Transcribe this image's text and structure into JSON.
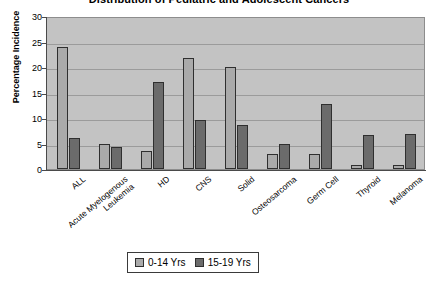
{
  "chart_data": {
    "type": "bar",
    "title": "Distribution of Pediatric and Adolescent Cancers",
    "xlabel": "",
    "ylabel": "Percentage Incidence",
    "ylim": [
      0,
      30
    ],
    "ytick_step": 5,
    "yticks": [
      0,
      5,
      10,
      15,
      20,
      25,
      30
    ],
    "grid": true,
    "legend_position": "bottom",
    "categories": [
      "ALL",
      "Acute Myelogenous Leukemia",
      "HD",
      "CNS",
      "Solid",
      "Osteosarcoma",
      "Germ Cell",
      "Thyroid",
      "Melanoma"
    ],
    "category_lines": [
      [
        "ALL",
        ""
      ],
      [
        "Acute Myelogenous",
        "Leukemia"
      ],
      [
        "HD",
        ""
      ],
      [
        "CNS",
        ""
      ],
      [
        "Solid",
        ""
      ],
      [
        "Osteosarcoma",
        ""
      ],
      [
        "Germ Cell",
        ""
      ],
      [
        "Thyroid",
        ""
      ],
      [
        "Melanoma",
        ""
      ]
    ],
    "series": [
      {
        "name": "0-14 Yrs",
        "color": "#aaaaaa",
        "values": [
          24,
          5,
          3.5,
          21.8,
          20,
          3,
          3,
          0.8,
          0.8
        ]
      },
      {
        "name": "15-19 Yrs",
        "color": "#6b6b6b",
        "values": [
          6,
          4.3,
          17,
          9.7,
          8.7,
          5,
          12.8,
          6.7,
          6.8
        ]
      }
    ]
  },
  "legend": {
    "items": [
      {
        "label": "0-14 Yrs"
      },
      {
        "label": "15-19 Yrs"
      }
    ]
  },
  "colors": {
    "plot_background": "#c3c3c3",
    "series_0": "#aaaaaa",
    "series_1": "#6b6b6b",
    "gridline": "#9b9b9b",
    "axis": "#4a4a4a"
  }
}
